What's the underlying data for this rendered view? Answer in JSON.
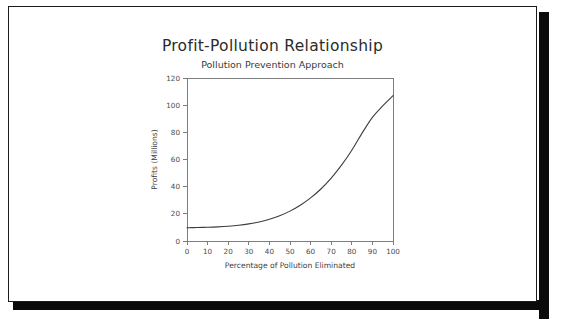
{
  "page": {
    "background": "#ffffff",
    "border_color": "#1b1b1b",
    "shadow_color": "#0a0a0a"
  },
  "chart_data": {
    "type": "line",
    "title": "Profit-Pollution Relationship",
    "subtitle": "Pollution Prevention Approach",
    "xlabel": "Percentage of Pollution Eliminated",
    "ylabel": "Profits (Millions)",
    "xlim": [
      0,
      100
    ],
    "ylim": [
      0,
      120
    ],
    "xticks": [
      0,
      10,
      20,
      30,
      40,
      50,
      60,
      70,
      80,
      90,
      100
    ],
    "yticks": [
      0,
      20,
      40,
      60,
      80,
      100,
      120
    ],
    "grid": false,
    "legend": false,
    "line_color": "#3d3d3d",
    "series": [
      {
        "name": "Profits",
        "x": [
          0,
          5,
          10,
          15,
          20,
          25,
          30,
          35,
          40,
          45,
          50,
          55,
          60,
          65,
          70,
          75,
          80,
          85,
          90,
          95,
          100
        ],
        "values": [
          9.8,
          9.9,
          10.1,
          10.4,
          10.9,
          11.6,
          12.6,
          14.0,
          16.0,
          18.6,
          22.0,
          26.3,
          31.7,
          38.3,
          46.3,
          55.8,
          66.8,
          79.4,
          91.0,
          99.5,
          107.0
        ]
      }
    ]
  }
}
